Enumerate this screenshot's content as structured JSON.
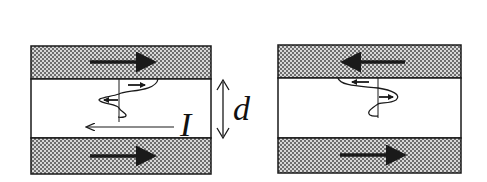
{
  "diagram": {
    "colors": {
      "stroke": "#1a1a1a",
      "shade_dark": "#6e6e6e",
      "shade_light": "#d8d8d8",
      "background": "#ffffff"
    },
    "labels": {
      "current": "I",
      "thickness": "d"
    },
    "left_panel": {
      "name": "parallel-configuration",
      "top_layer_arrow": "right",
      "bottom_layer_arrow": "right",
      "wave_small_arrows": [
        "right",
        "left"
      ],
      "current_arrow": "left"
    },
    "right_panel": {
      "name": "antiparallel-configuration",
      "top_layer_arrow": "left",
      "bottom_layer_arrow": "right",
      "wave_small_arrows": [
        "left",
        "right"
      ]
    }
  }
}
